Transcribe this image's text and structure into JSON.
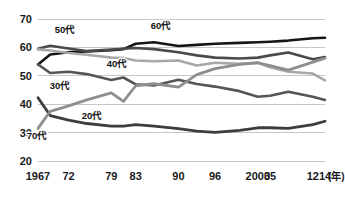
{
  "chart_data": {
    "type": "line",
    "title": "",
    "subtitle": "",
    "xlabel": "(年)",
    "ylabel": "",
    "grid": true,
    "legend_position": "inline-labels",
    "xlim": [
      1967,
      2014
    ],
    "ylim": [
      20,
      70
    ],
    "yticks": [
      20,
      30,
      40,
      50,
      60,
      70
    ],
    "ytick_labels": [
      "20",
      "30",
      "40",
      "50",
      "60",
      "70"
    ],
    "x": [
      1967,
      1972,
      1979,
      1983,
      1990,
      1996,
      2003,
      2005,
      2012,
      2014
    ],
    "xtick_labels": [
      "1967",
      "72",
      "79",
      "83",
      "90",
      "96",
      "2003",
      "05",
      "12",
      "14"
    ],
    "unit_suffix": "(年)",
    "series": [
      {
        "name": "60代",
        "label": "60代",
        "color": "#161616",
        "width": 2.6,
        "x": [
          1967,
          1969,
          1972,
          1975,
          1979,
          1981,
          1983,
          1986,
          1990,
          1993,
          1996,
          2000,
          2003,
          2005,
          2008,
          2012,
          2014
        ],
        "values": [
          54.0,
          57.5,
          58.3,
          58.6,
          59.0,
          59.4,
          61.3,
          61.8,
          60.5,
          60.9,
          61.3,
          61.6,
          61.8,
          62.0,
          62.4,
          63.2,
          63.4
        ]
      },
      {
        "name": "50代",
        "label": "50代",
        "color": "#4a4a4a",
        "width": 2.6,
        "x": [
          1967,
          1969,
          1972,
          1975,
          1979,
          1981,
          1983,
          1986,
          1990,
          1993,
          1996,
          2000,
          2003,
          2005,
          2008,
          2012,
          2014
        ],
        "values": [
          59.5,
          60.6,
          59.6,
          58.7,
          59.2,
          59.5,
          59.8,
          59.4,
          58.3,
          57.2,
          56.4,
          56.1,
          56.4,
          57.2,
          58.2,
          55.8,
          56.6
        ]
      },
      {
        "name": "40代",
        "label": "40代",
        "color": "#a8a8a8",
        "width": 2.6,
        "x": [
          1967,
          1969,
          1972,
          1975,
          1979,
          1981,
          1983,
          1986,
          1990,
          1993,
          1996,
          2000,
          2003,
          2005,
          2008,
          2012,
          2014
        ],
        "values": [
          59.3,
          58.9,
          58.0,
          57.4,
          56.4,
          56.3,
          55.4,
          55.1,
          55.4,
          53.6,
          54.6,
          54.2,
          54.6,
          53.0,
          51.4,
          50.8,
          48.4
        ]
      },
      {
        "name": "30代",
        "label": "30代",
        "color": "#555555",
        "width": 2.6,
        "x": [
          1967,
          1969,
          1972,
          1975,
          1979,
          1981,
          1983,
          1986,
          1990,
          1993,
          1996,
          2000,
          2003,
          2005,
          2008,
          2012,
          2014
        ],
        "values": [
          54.0,
          51.0,
          51.4,
          50.6,
          48.5,
          49.4,
          47.0,
          46.6,
          48.6,
          47.1,
          46.2,
          44.6,
          42.6,
          43.0,
          44.4,
          42.6,
          41.5
        ]
      },
      {
        "name": "20代",
        "label": "20代",
        "color": "#3d3d3d",
        "width": 2.8,
        "x": [
          1967,
          1969,
          1972,
          1975,
          1979,
          1981,
          1983,
          1986,
          1990,
          1993,
          1996,
          2000,
          2003,
          2005,
          2008,
          2012,
          2014
        ],
        "values": [
          42.3,
          36.0,
          34.4,
          33.2,
          32.3,
          32.3,
          32.8,
          32.3,
          31.4,
          30.5,
          30.1,
          30.8,
          31.7,
          31.7,
          31.5,
          32.8,
          34.0
        ]
      },
      {
        "name": "70代",
        "label": "70代",
        "color": "#8e8e8e",
        "width": 2.8,
        "x": [
          1967,
          1969,
          1972,
          1975,
          1979,
          1981,
          1983,
          1986,
          1990,
          1993,
          1996,
          2000,
          2003,
          2005,
          2008,
          2012,
          2014
        ],
        "values": [
          31.5,
          37.5,
          39.4,
          41.5,
          44.0,
          41.0,
          46.5,
          47.2,
          46.0,
          50.4,
          52.5,
          54.0,
          54.6,
          53.6,
          52.0,
          54.8,
          56.2
        ]
      }
    ],
    "annotations": [
      {
        "text": "50代",
        "x_px": 65,
        "y_px": 33
      },
      {
        "text": "60代",
        "x_px": 161,
        "y_px": 29
      },
      {
        "text": "40代",
        "x_px": 117,
        "y_px": 67
      },
      {
        "text": "30代",
        "x_px": 60,
        "y_px": 89
      },
      {
        "text": "20代",
        "x_px": 92,
        "y_px": 119
      },
      {
        "text": "70代",
        "x_px": 37,
        "y_px": 139
      }
    ]
  }
}
